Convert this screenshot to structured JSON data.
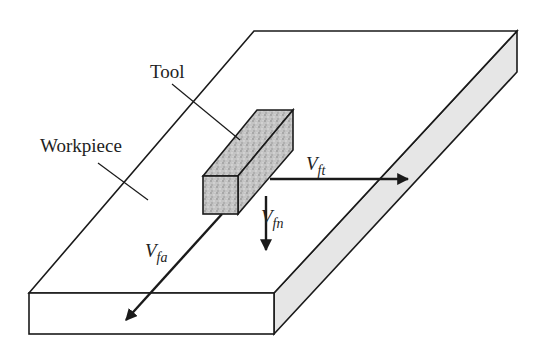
{
  "diagram": {
    "labels": {
      "tool": "Tool",
      "workpiece": "Workpiece"
    },
    "vectors": [
      {
        "id": "vft",
        "main": "V",
        "sub": "ft",
        "description": "tangential feed velocity"
      },
      {
        "id": "vfn",
        "main": "V",
        "sub": "fn",
        "description": "normal feed velocity"
      },
      {
        "id": "vfa",
        "main": "V",
        "sub": "fa",
        "description": "axial feed velocity"
      }
    ],
    "colors": {
      "line": "#1a1a1a",
      "side_face": "#e6e6e6",
      "tool_fill": "#b8b8b8",
      "background": "#ffffff"
    }
  }
}
